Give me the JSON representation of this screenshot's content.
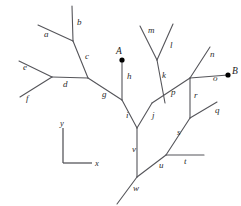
{
  "diagram": {
    "stroke_color": "#55555a",
    "axis_color": "#4a4a4f",
    "point_color": "#000000",
    "background_color": "#ffffff",
    "points": [
      {
        "id": "A",
        "label": "A",
        "x": 122,
        "y": 60,
        "label_x": 116,
        "label_y": 54
      },
      {
        "id": "B",
        "label": "B",
        "x": 228,
        "y": 75,
        "label_x": 232,
        "label_y": 74
      }
    ],
    "segments": [
      {
        "id": "a",
        "label": "a",
        "x1": 38,
        "y1": 25,
        "x2": 73,
        "y2": 41,
        "label_x": 44,
        "label_y": 37
      },
      {
        "id": "b",
        "label": "b",
        "x1": 72,
        "y1": 6,
        "x2": 73,
        "y2": 41,
        "label_x": 77,
        "label_y": 25
      },
      {
        "id": "c",
        "label": "c",
        "x1": 73,
        "y1": 41,
        "x2": 88,
        "y2": 78,
        "label_x": 85,
        "label_y": 59
      },
      {
        "id": "d",
        "label": "d",
        "x1": 52,
        "y1": 77,
        "x2": 88,
        "y2": 78,
        "label_x": 63,
        "label_y": 87
      },
      {
        "id": "e",
        "label": "e",
        "x1": 19,
        "y1": 61,
        "x2": 52,
        "y2": 77,
        "label_x": 23,
        "label_y": 70
      },
      {
        "id": "f",
        "label": "f",
        "x1": 20,
        "y1": 97,
        "x2": 52,
        "y2": 77,
        "label_x": 26,
        "label_y": 101
      },
      {
        "id": "g",
        "label": "g",
        "x1": 88,
        "y1": 78,
        "x2": 122,
        "y2": 100,
        "label_x": 102,
        "label_y": 97
      },
      {
        "id": "h",
        "label": "h",
        "x1": 122,
        "y1": 60,
        "x2": 122,
        "y2": 100,
        "label_x": 127,
        "label_y": 79
      },
      {
        "id": "i",
        "label": "i",
        "x1": 122,
        "y1": 100,
        "x2": 137,
        "y2": 128,
        "label_x": 126,
        "label_y": 118
      },
      {
        "id": "j",
        "label": "j",
        "x1": 137,
        "y1": 128,
        "x2": 152,
        "y2": 103,
        "label_x": 152,
        "label_y": 118
      },
      {
        "id": "k",
        "label": "k",
        "x1": 157,
        "y1": 60,
        "x2": 165,
        "y2": 103,
        "label_x": 162,
        "label_y": 78
      },
      {
        "id": "l",
        "label": "l",
        "x1": 173,
        "y1": 24,
        "x2": 157,
        "y2": 60,
        "label_x": 170,
        "label_y": 48
      },
      {
        "id": "m",
        "label": "m",
        "x1": 140,
        "y1": 26,
        "x2": 157,
        "y2": 60,
        "label_x": 148,
        "label_y": 33
      },
      {
        "id": "n",
        "label": "n",
        "x1": 210,
        "y1": 47,
        "x2": 190,
        "y2": 78,
        "label_x": 210,
        "label_y": 57
      },
      {
        "id": "o",
        "label": "o",
        "x1": 190,
        "y1": 78,
        "x2": 228,
        "y2": 75,
        "label_x": 213,
        "label_y": 81
      },
      {
        "id": "p",
        "label": "p",
        "x1": 152,
        "y1": 103,
        "x2": 190,
        "y2": 78,
        "label_x": 171,
        "label_y": 95
      },
      {
        "id": "q",
        "label": "q",
        "x1": 217,
        "y1": 102,
        "x2": 190,
        "y2": 118,
        "label_x": 215,
        "label_y": 113
      },
      {
        "id": "r",
        "label": "r",
        "x1": 190,
        "y1": 78,
        "x2": 190,
        "y2": 118,
        "label_x": 194,
        "label_y": 98
      },
      {
        "id": "s",
        "label": "s",
        "x1": 190,
        "y1": 118,
        "x2": 166,
        "y2": 155,
        "label_x": 177,
        "label_y": 135
      },
      {
        "id": "t",
        "label": "t",
        "x1": 166,
        "y1": 155,
        "x2": 204,
        "y2": 155,
        "label_x": 184,
        "label_y": 164
      },
      {
        "id": "u",
        "label": "u",
        "x1": 137,
        "y1": 177,
        "x2": 166,
        "y2": 155,
        "label_x": 159,
        "label_y": 168
      },
      {
        "id": "v",
        "label": "v",
        "x1": 137,
        "y1": 128,
        "x2": 137,
        "y2": 177,
        "label_x": 132,
        "label_y": 152
      },
      {
        "id": "w",
        "label": "w",
        "x1": 137,
        "y1": 177,
        "x2": 117,
        "y2": 204,
        "label_x": 133,
        "label_y": 191
      }
    ],
    "axes": {
      "corner_x": 63,
      "corner_y": 163,
      "y_top": 128,
      "x_right": 92,
      "x_label": "x",
      "y_label": "y",
      "x_label_x": 95,
      "x_label_y": 166,
      "y_label_x": 60,
      "y_label_y": 126
    }
  }
}
